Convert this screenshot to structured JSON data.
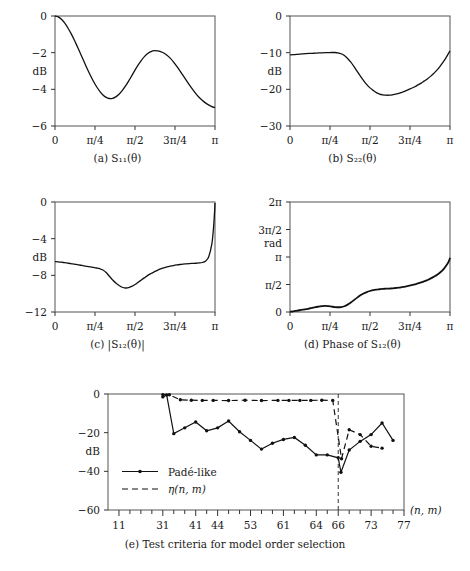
{
  "figure": {
    "panels": [
      {
        "id": "a",
        "caption": "(a) S₁₁(θ)",
        "ylabel": "dB",
        "xticks": [
          "0",
          "π/4",
          "π/2",
          "3π/4",
          "π"
        ],
        "yticks": [
          "0",
          "−2",
          "−4",
          "−6"
        ]
      },
      {
        "id": "b",
        "caption": "(b) S₂₂(θ)",
        "ylabel": "dB",
        "xticks": [
          "0",
          "π/4",
          "π/2",
          "3π/4",
          "π"
        ],
        "yticks": [
          "0",
          "−10",
          "−20",
          "−30"
        ]
      },
      {
        "id": "c",
        "caption": "(c) |S₁₂(θ)|",
        "ylabel": "dB",
        "xticks": [
          "0",
          "π/4",
          "π/2",
          "3π/4",
          "π"
        ],
        "yticks": [
          "0",
          "−4",
          "−8",
          "−12"
        ]
      },
      {
        "id": "d",
        "caption": "(d) Phase of S₁₂(θ)",
        "ylabel": "rad",
        "xticks": [
          "0",
          "π/4",
          "π/2",
          "3π/4",
          "π"
        ],
        "yticks": [
          "0",
          "π/2",
          "π",
          "3π/2",
          "2π"
        ]
      },
      {
        "id": "e",
        "caption": "(e) Test criteria for model order selection",
        "ylabel": "dB",
        "xlabel": "(n, m)",
        "xticks": [
          "11",
          "31",
          "41",
          "44",
          "53",
          "61",
          "64",
          "66",
          "73",
          "77"
        ],
        "yticks": [
          "0",
          "−20",
          "−40",
          "−60"
        ],
        "legend": [
          "Padé-like",
          "η(n, m)"
        ]
      }
    ]
  },
  "chart_data": [
    {
      "type": "line",
      "id": "a",
      "title": "(a) S11(theta)",
      "xlabel": "",
      "ylabel": "dB",
      "xlim": [
        0,
        3.14159
      ],
      "ylim": [
        -6,
        0
      ],
      "xtick_values": [
        0,
        0.7854,
        1.5708,
        2.3562,
        3.14159
      ],
      "xtick_labels": [
        "0",
        "π/4",
        "π/2",
        "3π/4",
        "π"
      ],
      "ytick_values": [
        0,
        -2,
        -4,
        -6
      ],
      "ytick_labels": [
        "0",
        "−2",
        "−4",
        "−6"
      ],
      "grid": false,
      "legend": "none",
      "x": [
        0.0,
        0.063,
        0.126,
        0.188,
        0.251,
        0.314,
        0.377,
        0.44,
        0.503,
        0.565,
        0.628,
        0.691,
        0.754,
        0.817,
        0.88,
        0.942,
        1.005,
        1.068,
        1.131,
        1.194,
        1.257,
        1.319,
        1.382,
        1.445,
        1.508,
        1.571,
        1.634,
        1.696,
        1.759,
        1.822,
        1.885,
        1.948,
        2.011,
        2.073,
        2.136,
        2.199,
        2.262,
        2.325,
        2.388,
        2.45,
        2.513,
        2.576,
        2.639,
        2.702,
        2.765,
        2.827,
        2.89,
        2.953,
        3.016,
        3.079,
        3.14159
      ],
      "y": [
        0.0,
        -0.05,
        -0.18,
        -0.38,
        -0.64,
        -0.95,
        -1.3,
        -1.68,
        -2.07,
        -2.46,
        -2.85,
        -3.22,
        -3.56,
        -3.86,
        -4.11,
        -4.31,
        -4.44,
        -4.5,
        -4.49,
        -4.41,
        -4.27,
        -4.07,
        -3.83,
        -3.55,
        -3.25,
        -2.95,
        -2.67,
        -2.42,
        -2.2,
        -2.04,
        -1.94,
        -1.89,
        -1.9,
        -1.94,
        -2.02,
        -2.14,
        -2.3,
        -2.5,
        -2.73,
        -2.98,
        -3.24,
        -3.5,
        -3.76,
        -4.0,
        -4.23,
        -4.43,
        -4.6,
        -4.74,
        -4.85,
        -4.94,
        -5.0
      ]
    },
    {
      "type": "line",
      "id": "b",
      "title": "(b) S22(theta)",
      "xlabel": "",
      "ylabel": "dB",
      "xlim": [
        0,
        3.14159
      ],
      "ylim": [
        -30,
        0
      ],
      "xtick_values": [
        0,
        0.7854,
        1.5708,
        2.3562,
        3.14159
      ],
      "xtick_labels": [
        "0",
        "π/4",
        "π/2",
        "3π/4",
        "π"
      ],
      "ytick_values": [
        0,
        -10,
        -20,
        -30
      ],
      "ytick_labels": [
        "0",
        "−10",
        "−20",
        "−30"
      ],
      "grid": false,
      "legend": "none",
      "x": [
        0.0,
        0.063,
        0.126,
        0.188,
        0.251,
        0.314,
        0.377,
        0.44,
        0.503,
        0.565,
        0.628,
        0.691,
        0.754,
        0.817,
        0.88,
        0.942,
        1.005,
        1.068,
        1.131,
        1.194,
        1.257,
        1.319,
        1.382,
        1.445,
        1.508,
        1.571,
        1.634,
        1.696,
        1.759,
        1.822,
        1.885,
        1.948,
        2.011,
        2.073,
        2.136,
        2.199,
        2.262,
        2.325,
        2.388,
        2.45,
        2.513,
        2.576,
        2.639,
        2.702,
        2.765,
        2.827,
        2.89,
        2.953,
        3.016,
        3.079,
        3.14159
      ],
      "y": [
        -10.6,
        -10.55,
        -10.48,
        -10.42,
        -10.35,
        -10.28,
        -10.22,
        -10.17,
        -10.12,
        -10.08,
        -10.04,
        -10.0,
        -9.97,
        -9.95,
        -9.96,
        -10.05,
        -10.3,
        -10.8,
        -11.6,
        -12.6,
        -13.8,
        -15.1,
        -16.4,
        -17.6,
        -18.7,
        -19.6,
        -20.3,
        -20.9,
        -21.3,
        -21.5,
        -21.6,
        -21.6,
        -21.5,
        -21.3,
        -21.1,
        -20.8,
        -20.5,
        -20.1,
        -19.7,
        -19.3,
        -18.8,
        -18.3,
        -17.7,
        -17.1,
        -16.4,
        -15.6,
        -14.7,
        -13.6,
        -12.4,
        -11.0,
        -9.5
      ]
    },
    {
      "type": "line",
      "id": "c",
      "title": "(c) |S12(theta)|",
      "xlabel": "",
      "ylabel": "dB",
      "xlim": [
        0,
        3.14159
      ],
      "ylim": [
        -12,
        0
      ],
      "xtick_values": [
        0,
        0.7854,
        1.5708,
        2.3562,
        3.14159
      ],
      "xtick_labels": [
        "0",
        "π/4",
        "π/2",
        "3π/4",
        "π"
      ],
      "ytick_values": [
        0,
        -4,
        -8,
        -12
      ],
      "ytick_labels": [
        "0",
        "−4",
        "−8",
        "−12"
      ],
      "grid": false,
      "legend": "none",
      "x": [
        0.0,
        0.063,
        0.126,
        0.188,
        0.251,
        0.314,
        0.377,
        0.44,
        0.503,
        0.565,
        0.628,
        0.691,
        0.754,
        0.817,
        0.88,
        0.942,
        1.005,
        1.068,
        1.131,
        1.194,
        1.257,
        1.319,
        1.382,
        1.445,
        1.508,
        1.571,
        1.634,
        1.696,
        1.759,
        1.822,
        1.885,
        1.948,
        2.011,
        2.073,
        2.136,
        2.199,
        2.262,
        2.325,
        2.388,
        2.45,
        2.513,
        2.576,
        2.639,
        2.702,
        2.765,
        2.827,
        2.89,
        2.953,
        3.016,
        3.079,
        3.11,
        3.125,
        3.135,
        3.14159
      ],
      "y": [
        -6.5,
        -6.53,
        -6.57,
        -6.62,
        -6.67,
        -6.72,
        -6.78,
        -6.84,
        -6.9,
        -6.96,
        -7.02,
        -7.08,
        -7.14,
        -7.2,
        -7.28,
        -7.42,
        -7.7,
        -8.1,
        -8.5,
        -8.85,
        -9.1,
        -9.3,
        -9.38,
        -9.35,
        -9.2,
        -9.0,
        -8.75,
        -8.5,
        -8.25,
        -8.0,
        -7.8,
        -7.62,
        -7.45,
        -7.3,
        -7.18,
        -7.08,
        -7.0,
        -6.93,
        -6.87,
        -6.82,
        -6.78,
        -6.75,
        -6.72,
        -6.7,
        -6.68,
        -6.65,
        -6.6,
        -6.45,
        -6.0,
        -4.6,
        -3.0,
        -1.8,
        -0.9,
        -0.1
      ]
    },
    {
      "type": "line",
      "id": "d",
      "title": "(d) Phase of S12(theta)",
      "xlabel": "",
      "ylabel": "rad",
      "xlim": [
        0,
        3.14159
      ],
      "ylim": [
        0,
        6.28319
      ],
      "xtick_values": [
        0,
        0.7854,
        1.5708,
        2.3562,
        3.14159
      ],
      "xtick_labels": [
        "0",
        "π/4",
        "π/2",
        "3π/4",
        "π"
      ],
      "ytick_values": [
        0,
        1.5708,
        3.14159,
        4.71239,
        6.28319
      ],
      "ytick_labels": [
        "0",
        "π/2",
        "π",
        "3π/2",
        "2π"
      ],
      "grid": false,
      "legend": "none",
      "x": [
        0.0,
        0.063,
        0.126,
        0.188,
        0.251,
        0.314,
        0.377,
        0.44,
        0.503,
        0.565,
        0.628,
        0.691,
        0.754,
        0.817,
        0.88,
        0.942,
        1.005,
        1.068,
        1.131,
        1.194,
        1.257,
        1.319,
        1.382,
        1.445,
        1.508,
        1.571,
        1.634,
        1.696,
        1.759,
        1.822,
        1.885,
        1.948,
        2.011,
        2.073,
        2.136,
        2.199,
        2.262,
        2.325,
        2.388,
        2.45,
        2.513,
        2.576,
        2.639,
        2.702,
        2.765,
        2.827,
        2.89,
        2.953,
        3.016,
        3.079,
        3.11,
        3.13,
        3.14159
      ],
      "y": [
        0.02,
        0.04,
        0.07,
        0.1,
        0.13,
        0.16,
        0.2,
        0.24,
        0.28,
        0.31,
        0.34,
        0.35,
        0.34,
        0.31,
        0.28,
        0.27,
        0.28,
        0.33,
        0.42,
        0.54,
        0.68,
        0.82,
        0.95,
        1.06,
        1.14,
        1.2,
        1.25,
        1.28,
        1.3,
        1.32,
        1.33,
        1.34,
        1.35,
        1.37,
        1.39,
        1.42,
        1.45,
        1.49,
        1.53,
        1.58,
        1.63,
        1.69,
        1.76,
        1.83,
        1.92,
        2.02,
        2.13,
        2.27,
        2.45,
        2.7,
        2.85,
        2.98,
        3.1
      ]
    },
    {
      "type": "line",
      "id": "e",
      "title": "(e) Test criteria for model order selection",
      "xlabel": "(n, m)",
      "ylabel": "dB",
      "xlim": [
        0,
        27
      ],
      "ylim": [
        -60,
        0
      ],
      "xtick_values": [
        1,
        5,
        8,
        10,
        13,
        16,
        19,
        21,
        24,
        27
      ],
      "xtick_labels": [
        "11",
        "31",
        "41",
        "44",
        "53",
        "61",
        "64",
        "66",
        "73",
        "77"
      ],
      "ytick_values": [
        0,
        -20,
        -40,
        -60
      ],
      "ytick_labels": [
        "0",
        "−20",
        "−40",
        "−60"
      ],
      "grid": false,
      "legend": "inside-lower-left",
      "vline_x": 21,
      "series": [
        {
          "name": "Padé-like",
          "style": "solid",
          "marker": "dot",
          "x": [
            5,
            5.35,
            6,
            7,
            8,
            9,
            10,
            11,
            12,
            13,
            14,
            15,
            16,
            17,
            18,
            19,
            20,
            21,
            21.25,
            22,
            23,
            24,
            25,
            26
          ],
          "y": [
            -1.5,
            -0.5,
            -20.5,
            -17.5,
            -14.5,
            -19.0,
            -17.5,
            -14.0,
            -19.5,
            -24.0,
            -28.5,
            -25.5,
            -23.5,
            -22.5,
            -26.5,
            -31.5,
            -31.5,
            -33.0,
            -40.5,
            -29.0,
            -24.5,
            -21.0,
            -15.0,
            -24.0
          ]
        },
        {
          "name": "η(n, m)",
          "style": "dashed",
          "marker": "dot",
          "x": [
            5,
            5.6,
            6.6,
            7.6,
            8.6,
            9.6,
            11,
            12.5,
            14,
            15.5,
            16.5,
            17.5,
            18.5,
            19.5,
            20.5,
            21.3,
            22,
            23,
            24,
            25
          ],
          "y": [
            -0.3,
            -0.4,
            -3.0,
            -3.2,
            -3.3,
            -3.3,
            -3.4,
            -3.2,
            -3.4,
            -3.3,
            -3.3,
            -3.3,
            -3.3,
            -3.2,
            -3.3,
            -33.5,
            -18.5,
            -21.0,
            -27.0,
            -28.0
          ]
        }
      ]
    }
  ]
}
